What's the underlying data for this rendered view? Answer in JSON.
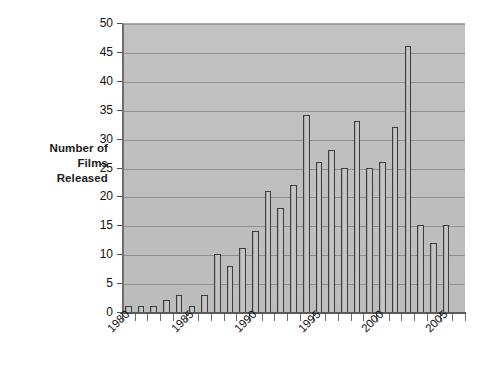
{
  "chart_data": {
    "type": "bar",
    "title": "",
    "xlabel": "",
    "ylabel": "Number of Films Released",
    "ylabel_lines": [
      "Number of",
      "Films",
      "Released"
    ],
    "ylim": [
      0,
      50
    ],
    "ytick_step": 5,
    "yticks": [
      0,
      5,
      10,
      15,
      20,
      25,
      30,
      35,
      40,
      45,
      50
    ],
    "ytick_labels": [
      "0",
      "5",
      "10",
      "15",
      "20",
      "25",
      "30",
      "35",
      "40",
      "45",
      "50"
    ],
    "grid": true,
    "legend": false,
    "legend_position": "none",
    "xtick_labels": [
      "1980",
      "1985",
      "1990",
      "1995",
      "2000",
      "2005"
    ],
    "xtick_label_years": [
      1980,
      1985,
      1990,
      1995,
      2000,
      2005
    ],
    "categories": [
      "1980",
      "1981",
      "1982",
      "1983",
      "1984",
      "1985",
      "1986",
      "1987",
      "1988",
      "1989",
      "1990",
      "1991",
      "1992",
      "1993",
      "1994",
      "1995",
      "1996",
      "1997",
      "1998",
      "1999",
      "2000",
      "2001",
      "2002",
      "2003",
      "2004",
      "2005",
      "2006"
    ],
    "values": [
      1,
      1,
      1,
      2,
      3,
      1,
      3,
      10,
      8,
      11,
      14,
      21,
      18,
      22,
      34,
      26,
      28,
      25,
      33,
      25,
      26,
      32,
      46,
      15,
      12,
      15,
      0
    ],
    "bar_fill_color": "#bdbdbd",
    "bar_edge_color": "#3d3d3d",
    "plot_background_color": "#bfbfbf",
    "gridline_color": "#8f8f8f",
    "axis_color": "#5a5a5a",
    "text_color": "#111111"
  }
}
